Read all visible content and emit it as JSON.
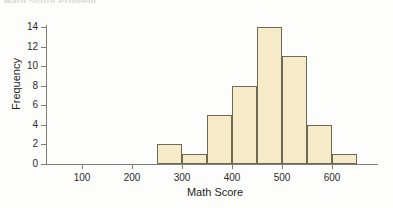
{
  "page": {
    "clipped_header_text": "Math Score Problem"
  },
  "chart_data": {
    "type": "bar",
    "title": "",
    "subtitle": "",
    "xlabel": "Math Score",
    "ylabel": "Frequency",
    "categories": [
      "250-300",
      "300-350",
      "350-400",
      "400-450",
      "450-500",
      "500-550",
      "550-600",
      "600-650"
    ],
    "bin_edges": [
      250,
      300,
      350,
      400,
      450,
      500,
      550,
      600,
      650
    ],
    "bin_width": 50,
    "values": [
      2,
      1,
      5,
      8,
      14,
      11,
      4,
      1
    ],
    "xlim": [
      0,
      680
    ],
    "ylim": [
      0,
      14.6
    ],
    "xticks": [
      100,
      200,
      300,
      400,
      500,
      600
    ],
    "xtick_labels": [
      "100",
      "200",
      "300",
      "400",
      "500",
      "600"
    ],
    "yticks": [
      0,
      2,
      4,
      6,
      8,
      10,
      12,
      14
    ],
    "ytick_labels": [
      "0",
      "2",
      "4",
      "6",
      "8",
      "10",
      "12",
      "14"
    ],
    "grid": false,
    "legend": null,
    "legend_position": "none",
    "annotations": [],
    "colors": {
      "bar_fill": "#f6eac8",
      "bar_stroke": "#6c6a55",
      "axis": "#7b7f78",
      "text": "#1d1d1d",
      "background": "#fdfdfb"
    }
  }
}
